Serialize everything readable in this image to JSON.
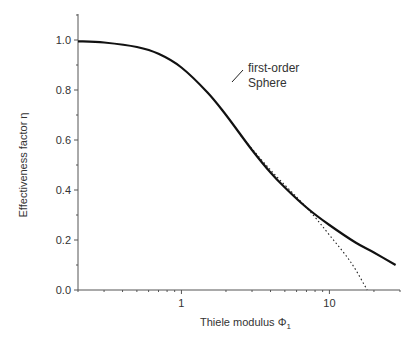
{
  "chart_data": {
    "type": "line",
    "title": "",
    "xlabel": "Thiele modulus Φ",
    "xlabel_subscript": "1",
    "ylabel": "Effectiveness factor η",
    "xscale": "log",
    "xlim": [
      0.2,
      30
    ],
    "ylim": [
      0.0,
      1.1
    ],
    "x_tick_labels": [
      "1",
      "10"
    ],
    "y_tick_labels": [
      "0.0",
      "0.2",
      "0.4",
      "0.6",
      "0.8",
      "1.0"
    ],
    "y_ticks": [
      0.0,
      0.2,
      0.4,
      0.6,
      0.8,
      1.0
    ],
    "grid": false,
    "legend": null,
    "annotation": {
      "line1": "first-order",
      "line2": "Sphere"
    },
    "series": [
      {
        "name": "first-order Sphere",
        "style": "solid",
        "x": [
          0.2,
          0.3,
          0.5,
          0.7,
          1.0,
          1.5,
          2.0,
          3.0,
          4.0,
          5.0,
          7.0,
          10.0,
          15.0,
          20.0,
          28.0
        ],
        "values": [
          0.995,
          0.99,
          0.972,
          0.945,
          0.89,
          0.79,
          0.7,
          0.56,
          0.47,
          0.41,
          0.33,
          0.26,
          0.19,
          0.15,
          0.1
        ]
      },
      {
        "name": "asymptote",
        "style": "dotted",
        "x": [
          2.5,
          4.0,
          7.0,
          10.0,
          14.0,
          18.0
        ],
        "values": [
          0.62,
          0.48,
          0.33,
          0.22,
          0.11,
          0.0
        ]
      }
    ]
  }
}
